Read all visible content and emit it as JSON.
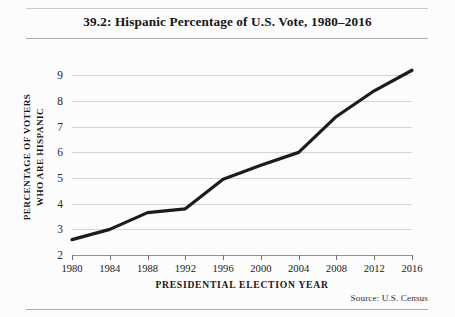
{
  "figure": {
    "title": "39.2: Hispanic Percentage of U.S. Vote, 1980–2016",
    "source_note": "Source:  U.S. Census",
    "background_color": "#fcfcfc",
    "rule_color": "#a9acb1"
  },
  "chart_data": {
    "type": "line",
    "title": "39.2: Hispanic Percentage of U.S. Vote, 1980–2016",
    "xlabel": "PRESIDENTIAL ELECTION YEAR",
    "ylabel": "PERCENTAGE OF VOTERS WHO ARE HISPANIC",
    "ylabel_lines": [
      "PERCENTAGE OF VOTERS",
      "WHO ARE HISPANIC"
    ],
    "x": [
      1980,
      1984,
      1988,
      1992,
      1996,
      2000,
      2004,
      2008,
      2012,
      2016
    ],
    "categories": [
      "1980",
      "1984",
      "1988",
      "1992",
      "1996",
      "2000",
      "2004",
      "2008",
      "2012",
      "2016"
    ],
    "values": [
      2.6,
      3.0,
      3.65,
      3.8,
      4.95,
      5.5,
      6.0,
      7.4,
      8.4,
      9.2
    ],
    "series": [
      {
        "name": "Percentage of voters who are Hispanic",
        "values": [
          2.6,
          3.0,
          3.65,
          3.8,
          4.95,
          5.5,
          6.0,
          7.4,
          8.4,
          9.2
        ],
        "color": "#1c1c1c",
        "line_width": 3.2
      }
    ],
    "xlim": [
      1980,
      2016
    ],
    "ylim": [
      2,
      9.6
    ],
    "ytick_values": [
      2,
      3,
      4,
      5,
      6,
      7,
      8,
      9
    ],
    "ytick_labels": [
      "2",
      "3",
      "4",
      "5",
      "6",
      "7",
      "8",
      "9"
    ],
    "xtick_labels": [
      "1980",
      "1984",
      "1988",
      "1992",
      "1996",
      "2000",
      "2004",
      "2008",
      "2012",
      "2016"
    ],
    "grid": true,
    "grid_axis": "y",
    "grid_color": "#d3d5d8",
    "legend": false,
    "legend_position": "none",
    "annotations": [
      "Source:  U.S. Census"
    ]
  }
}
